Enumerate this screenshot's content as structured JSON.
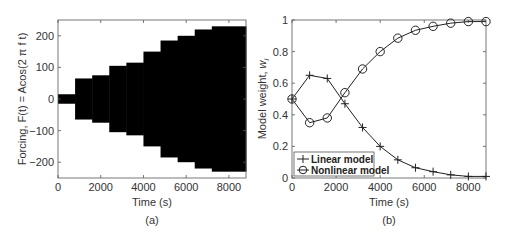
{
  "chart_data": [
    {
      "type": "area",
      "panel_label": "(a)",
      "title": "",
      "xlabel": "Time (s)",
      "ylabel": "Forcing, F(t) = Acos(2 π f t)",
      "xlim": [
        0,
        8800
      ],
      "ylim": [
        -250,
        250
      ],
      "xticks": [
        0,
        2000,
        4000,
        6000,
        8000
      ],
      "xtick_labels": [
        "0",
        "2000",
        "4000",
        "6000",
        "8000"
      ],
      "yticks": [
        -200,
        -100,
        0,
        100,
        200
      ],
      "ytick_labels": [
        "-200",
        "-100",
        "0",
        "100",
        "200"
      ],
      "grid": false,
      "description": "Stepwise increasing amplitude oscillation envelope (filled black)",
      "steps": [
        {
          "t_start": 0,
          "t_end": 800,
          "amplitude": 15
        },
        {
          "t_start": 800,
          "t_end": 1600,
          "amplitude": 65
        },
        {
          "t_start": 1600,
          "t_end": 2400,
          "amplitude": 75
        },
        {
          "t_start": 2400,
          "t_end": 3200,
          "amplitude": 105
        },
        {
          "t_start": 3200,
          "t_end": 4000,
          "amplitude": 115
        },
        {
          "t_start": 4000,
          "t_end": 4800,
          "amplitude": 150
        },
        {
          "t_start": 4800,
          "t_end": 5600,
          "amplitude": 185
        },
        {
          "t_start": 5600,
          "t_end": 6400,
          "amplitude": 200
        },
        {
          "t_start": 6400,
          "t_end": 7200,
          "amplitude": 220
        },
        {
          "t_start": 7200,
          "t_end": 8800,
          "amplitude": 230
        }
      ],
      "fill_color": "#000000"
    },
    {
      "type": "line",
      "panel_label": "(b)",
      "title": "",
      "xlabel": "Time (s)",
      "ylabel": "Model weight, w_i",
      "ylabel_main": "Model weight, ",
      "ylabel_var": "w",
      "ylabel_sub": "i",
      "xlim": [
        0,
        8800
      ],
      "ylim": [
        0,
        1
      ],
      "xticks": [
        0,
        2000,
        4000,
        6000,
        8000
      ],
      "xtick_labels": [
        "0",
        "2000",
        "4000",
        "6000",
        "8000"
      ],
      "yticks": [
        0,
        0.2,
        0.4,
        0.6,
        0.8,
        1
      ],
      "ytick_labels": [
        "0",
        "0.2",
        "0.4",
        "0.6",
        "0.8",
        "1"
      ],
      "grid": false,
      "legend_position": "lower left",
      "x": [
        0,
        800,
        1600,
        2400,
        3200,
        4000,
        4800,
        5600,
        6400,
        7200,
        8000,
        8800
      ],
      "series": [
        {
          "name": "Linear model",
          "marker": "+",
          "values": [
            0.5,
            0.65,
            0.63,
            0.47,
            0.32,
            0.2,
            0.115,
            0.065,
            0.04,
            0.02,
            0.01,
            0.01
          ]
        },
        {
          "name": "Nonlinear model",
          "marker": "o",
          "values": [
            0.5,
            0.35,
            0.38,
            0.54,
            0.69,
            0.8,
            0.885,
            0.935,
            0.96,
            0.98,
            0.99,
            0.99
          ]
        }
      ]
    }
  ]
}
